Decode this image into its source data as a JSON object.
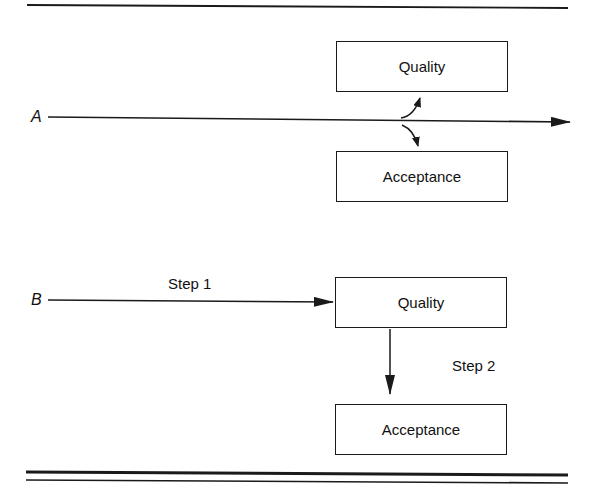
{
  "diagram": {
    "panel_a": {
      "label": "A",
      "boxes": [
        {
          "id": "quality",
          "text": "Quality"
        },
        {
          "id": "acceptance",
          "text": "Acceptance"
        }
      ]
    },
    "panel_b": {
      "label": "B",
      "step1_label": "Step 1",
      "step2_label": "Step 2",
      "boxes": [
        {
          "id": "quality",
          "text": "Quality"
        },
        {
          "id": "acceptance",
          "text": "Acceptance"
        }
      ]
    }
  },
  "colors": {
    "line": "#1a1a1a",
    "background": "#ffffff"
  }
}
